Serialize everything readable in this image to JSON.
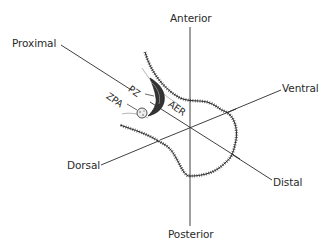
{
  "diagram": {
    "axes": {
      "anterior": "Anterior",
      "posterior": "Posterior",
      "proximal": "Proximal",
      "distal": "Distal",
      "dorsal": "Dorsal",
      "ventral": "Ventral"
    },
    "regions": {
      "pz": "PZ",
      "zpa": "ZPA",
      "aer": "AER"
    },
    "colors": {
      "line": "#2a2a2a",
      "background": "#ffffff"
    }
  }
}
